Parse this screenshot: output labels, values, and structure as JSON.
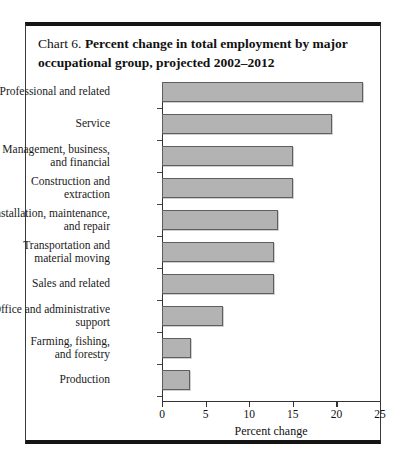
{
  "chart": {
    "number_label": "Chart 6.",
    "title": "Percent change in total employment by major occupational group, projected 2002–2012"
  },
  "axis": {
    "x_title": "Percent change",
    "tick_labels": [
      "0",
      "5",
      "10",
      "15",
      "20",
      "25"
    ]
  },
  "colors": {
    "bar_fill": "#b3b3b3",
    "bar_border": "#5e5e5e",
    "axis": "#333333",
    "frame_rule": "#151515"
  },
  "chart_data": {
    "type": "bar",
    "orientation": "horizontal",
    "title": "Chart 6. Percent change in total employment by major occupational group, projected 2002–2012",
    "xlabel": "Percent change",
    "ylabel": "",
    "xlim": [
      0,
      25
    ],
    "xticks": [
      0,
      5,
      10,
      15,
      20,
      25
    ],
    "grid": false,
    "legend": "none",
    "categories": [
      "Professional and related",
      "Service",
      "Management, business, and financial",
      "Construction and extraction",
      "Installation, maintenance, and repair",
      "Transportation and material moving",
      "Sales and related",
      "Office and administrative support",
      "Farming, fishing, and forestry",
      "Production"
    ],
    "category_lines": [
      [
        "Professional and related"
      ],
      [
        "Service"
      ],
      [
        "Management, business,",
        "and financial"
      ],
      [
        "Construction and",
        "extraction"
      ],
      [
        "Installation, maintenance,",
        "and repair"
      ],
      [
        "Transportation and",
        "material moving"
      ],
      [
        "Sales and related"
      ],
      [
        "Office and administrative",
        "support"
      ],
      [
        "Farming, fishing,",
        "and forestry"
      ],
      [
        "Production"
      ]
    ],
    "values": [
      23.0,
      19.5,
      15.0,
      15.0,
      13.3,
      12.8,
      12.8,
      7.0,
      3.3,
      3.2
    ]
  }
}
